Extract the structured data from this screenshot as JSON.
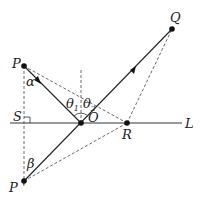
{
  "diagram": {
    "type": "reflection-geometry",
    "points": {
      "P": {
        "label": "P",
        "x": 24,
        "y": 66
      },
      "Q": {
        "label": "Q",
        "x": 172,
        "y": 29
      },
      "O": {
        "label": "O",
        "x": 81,
        "y": 123
      },
      "R": {
        "label": "R",
        "x": 127,
        "y": 123
      },
      "P_prime": {
        "label": "P '",
        "x": 24,
        "y": 181
      },
      "S": {
        "label": "S",
        "x": 25,
        "y": 123
      }
    },
    "line_label": "L",
    "angles": {
      "alpha": "α",
      "beta": "β",
      "theta1": "θ",
      "theta1_sub": "1",
      "theta2": "θ",
      "theta2_sub": "2"
    },
    "colors": {
      "line": "#222222",
      "dashed": "#444444",
      "point": "#111111"
    }
  }
}
